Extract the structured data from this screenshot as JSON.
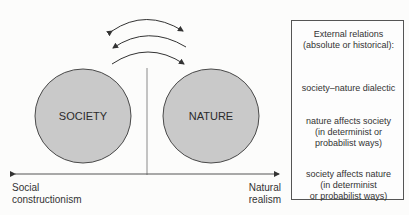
{
  "diagram": {
    "circles": [
      {
        "id": "society",
        "label": "SOCIETY"
      },
      {
        "id": "nature",
        "label": "NATURE"
      }
    ],
    "axis": {
      "left_label_line1": "Social",
      "left_label_line2": "constructionism",
      "right_label_line1": "Natural",
      "right_label_line2": "realism"
    },
    "arrows_between_circles": [
      {
        "type": "bidirectional",
        "meaning": "society-nature dialectic"
      },
      {
        "type": "toward-society",
        "meaning": "nature affects society"
      },
      {
        "type": "toward-nature",
        "meaning": "society affects nature"
      }
    ],
    "colors": {
      "circle_fill": "#c9c9c9",
      "circle_stroke": "#4a4a4a",
      "line": "#555555",
      "axis_divider": "#8a8a8a"
    }
  },
  "legend": {
    "title_line1": "External relations",
    "title_line2": "(absolute or historical):",
    "items": [
      {
        "arrow": "bidirectional",
        "line1": "society–nature dialectic",
        "line2": "",
        "line3": ""
      },
      {
        "arrow": "toward-left",
        "line1": "nature affects society",
        "line2": "(in determinist or",
        "line3": "probabilist ways)"
      },
      {
        "arrow": "toward-right",
        "line1": "society affects nature",
        "line2": "(in determinist",
        "line3": "or probabilist ways)"
      }
    ]
  }
}
